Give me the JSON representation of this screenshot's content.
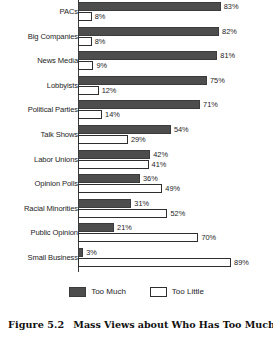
{
  "caption": {
    "number": "Figure 5.2",
    "title": "Mass Views about Who Has Too Much"
  },
  "legend": {
    "much_label": "Too Much",
    "little_label": "Too Little",
    "much_color": "#4d4d4d",
    "little_color": "#ffffff"
  },
  "chart_data": {
    "type": "bar",
    "orientation": "horizontal",
    "grouped": true,
    "title": "Mass Views about Who Has Too Much",
    "xlabel": "",
    "ylabel": "",
    "xlim": [
      0,
      100
    ],
    "xunit": "%",
    "grid": false,
    "legend_position": "bottom-center",
    "categories": [
      "PACs",
      "Big Companies",
      "News Media",
      "Lobbyists",
      "Political Parties",
      "Talk Shows",
      "Labor Unions",
      "Opinion Polls",
      "Racial Minorities",
      "Public Opinion",
      "Small Business"
    ],
    "series": [
      {
        "name": "Too Much",
        "color": "#4d4d4d",
        "values": [
          83,
          82,
          81,
          75,
          71,
          54,
          42,
          36,
          31,
          21,
          3
        ],
        "labels": [
          "83%",
          "82%",
          "81%",
          "75%",
          "71%",
          "54%",
          "42%",
          "36%",
          "31%",
          "21%",
          "3%"
        ]
      },
      {
        "name": "Too Little",
        "color": "#ffffff",
        "values": [
          8,
          8,
          9,
          12,
          14,
          29,
          41,
          49,
          52,
          70,
          89
        ],
        "labels": [
          "8%",
          "8%",
          "9%",
          "12%",
          "14%",
          "29%",
          "41%",
          "49%",
          "52%",
          "70%",
          "89%"
        ]
      }
    ]
  }
}
